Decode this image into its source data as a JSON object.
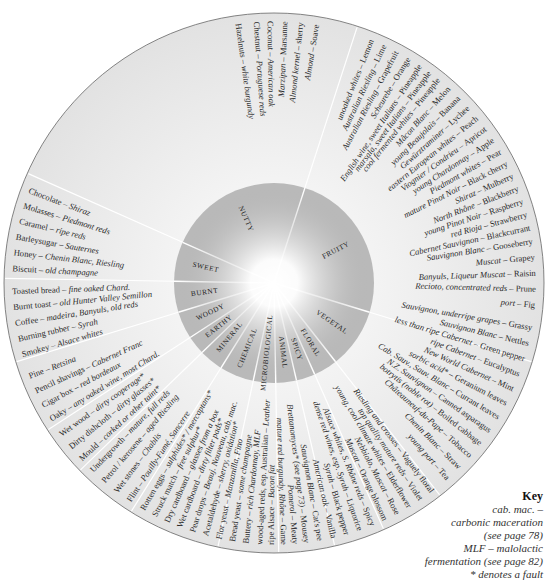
{
  "wheel": {
    "center": [
      274,
      283
    ],
    "outer_radius": 270,
    "inner_radius": 100,
    "colors": {
      "outer_ring": "#e9e9e9",
      "inner_ring": "#b9b9b9",
      "center_glow": "#ffffff",
      "divider": "#ffffff",
      "outline": "#666666"
    },
    "categories": [
      {
        "name": "FRUITY",
        "start": -72,
        "end": 17
      },
      {
        "name": "VEGETAL",
        "start": 17,
        "end": 52
      },
      {
        "name": "FLORAL",
        "start": 52,
        "end": 66
      },
      {
        "name": "SPICY",
        "start": 66,
        "end": 77
      },
      {
        "name": "ANIMAL",
        "start": 77,
        "end": 89
      },
      {
        "name": "MICROBIOLOGICAL",
        "start": 89,
        "end": 102
      },
      {
        "name": "CHEMICAL",
        "start": 102,
        "end": 122
      },
      {
        "name": "MINERAL",
        "start": 122,
        "end": 136
      },
      {
        "name": "EARTHY",
        "start": 136,
        "end": 147
      },
      {
        "name": "WOODY",
        "start": 147,
        "end": 163
      },
      {
        "name": "BURNT",
        "start": 163,
        "end": 181
      },
      {
        "name": "SWEET",
        "start": 181,
        "end": 204
      },
      {
        "name": "NUTTY",
        "start": 204,
        "end": 288
      }
    ],
    "aromas": [
      {
        "a": -98,
        "wine": "Hazelnuts",
        "aroma": "white burgundy"
      },
      {
        "a": -94,
        "wine": "Chestnut",
        "aroma": "Portuguese reds"
      },
      {
        "a": -91,
        "wine": "Coconut",
        "aroma": "American oak"
      },
      {
        "a": -87.5,
        "wine": "Marzipan",
        "aroma": "Marsanne"
      },
      {
        "a": -84,
        "wine": "Almond kernel",
        "aroma": "sherry"
      },
      {
        "a": -80.5,
        "wine": "Almond",
        "aroma": "Soave"
      },
      {
        "a": -68,
        "wine": "unoaked whites",
        "aroma": "Lemon",
        "tag": "lemon"
      },
      {
        "a": -65,
        "wine": "Australian Riesling",
        "aroma": "Lime"
      },
      {
        "a": -62,
        "wine": "Australian Riesling",
        "aroma": "Grapefruit"
      },
      {
        "a": -59,
        "wine": "Scheurebe",
        "aroma": "Orange"
      },
      {
        "a": -56,
        "wine": "English wine, sweet Italians",
        "aroma": "Pineapple"
      },
      {
        "a": -53.5,
        "wine": "marsala, sweet Italians",
        "aroma": "Pineapple"
      },
      {
        "a": -51,
        "wine": "cool fermented whites",
        "aroma": "Pineapple"
      },
      {
        "a": -48,
        "wine": "Mâcon Blanc",
        "aroma": "Melon"
      },
      {
        "a": -45,
        "wine": "young Beaujolais",
        "aroma": "Banana"
      },
      {
        "a": -42,
        "wine": "Gewürztraminer",
        "aroma": "Lychee"
      },
      {
        "a": -39,
        "wine": "eastern European whites",
        "aroma": "Peach"
      },
      {
        "a": -36,
        "wine": "Viognier / Condrieu",
        "aroma": "Apricot"
      },
      {
        "a": -33,
        "wine": "young Chardonnay",
        "aroma": "Apple"
      },
      {
        "a": -30,
        "wine": "Piedmont whites",
        "aroma": "Pear"
      },
      {
        "a": -27,
        "wine": "mature Pinot Noir",
        "aroma": "Black cherry"
      },
      {
        "a": -24,
        "wine": "Shiraz",
        "aroma": "Mulberry"
      },
      {
        "a": -21,
        "wine": "North Rhône",
        "aroma": "Blackberry"
      },
      {
        "a": -18,
        "wine": "young Pinot Noir",
        "aroma": "Raspberry"
      },
      {
        "a": -15,
        "wine": "red Rioja",
        "aroma": "Strawberry"
      },
      {
        "a": -12,
        "wine": "Cabernet Sauvignon",
        "aroma": "Blackcurrant"
      },
      {
        "a": -9,
        "wine": "Sauvignon Blanc",
        "aroma": "Gooseberry"
      },
      {
        "a": -5.5,
        "wine": "Muscat",
        "aroma": "Grapey"
      },
      {
        "a": -2,
        "wine": "Banyuls, Liqueur Muscat",
        "aroma": "Raisin"
      },
      {
        "a": 1.5,
        "wine": "Recioto, concentrated reds",
        "aroma": "Prune"
      },
      {
        "a": 5,
        "wine": "port",
        "aroma": "Fig"
      },
      {
        "a": 10,
        "wine": "Sauvignon, underripe grapes",
        "aroma": "Grassy"
      },
      {
        "a": 13.5,
        "wine": "Sauvignon Blanc",
        "aroma": "Nettles"
      },
      {
        "a": 17,
        "wine": "less than ripe Cabernet",
        "aroma": "Green pepper"
      },
      {
        "a": 20.5,
        "wine": "ripe Cabernet",
        "aroma": "Eucalyptus"
      },
      {
        "a": 24,
        "wine": "New World Cabernet",
        "aroma": "Mint"
      },
      {
        "a": 27.5,
        "wine": "sorbic acid*",
        "aroma": "Geranium leaves"
      },
      {
        "a": 31,
        "wine": "Cab. Sauv., Sauv. Blanc",
        "aroma": "Currant leaves"
      },
      {
        "a": 34.5,
        "wine": "N.Z. Sauvignon",
        "aroma": "Canned asparagus"
      },
      {
        "a": 38,
        "wine": "botrytis (noble rot)",
        "aroma": "Boiled cabbage"
      },
      {
        "a": 41.5,
        "wine": "Châteauneuf-du-Pape",
        "aroma": "Tobacco"
      },
      {
        "a": 45,
        "wine": "Chenin Blanc",
        "aroma": "Straw"
      },
      {
        "a": 48.5,
        "wine": "young port",
        "aroma": "Tea"
      },
      {
        "a": 53,
        "wine": "Riesling and crosses",
        "aroma": "Vaguely floral"
      },
      {
        "a": 56,
        "wine": "top quality mature reds",
        "aroma": "Violet"
      },
      {
        "a": 59,
        "wine": "young, cool climate whites",
        "aroma": "Elderflower"
      },
      {
        "a": 62,
        "wine": "Nebbiolo, Muscat",
        "aroma": "Rose"
      },
      {
        "a": 65,
        "wine": "Muscat",
        "aroma": "Orange blossom"
      },
      {
        "a": 68,
        "wine": "Alsace whites, S. Rhône reds",
        "aroma": "Spicy"
      },
      {
        "a": 71,
        "wine": "dense red wines, esp. Syrah",
        "aroma": "Liquorice"
      },
      {
        "a": 74,
        "wine": "Syrah",
        "aroma": "Black pepper"
      },
      {
        "a": 77,
        "wine": "American oak",
        "aroma": "Vanilla"
      },
      {
        "a": 80,
        "wine": "Sauvignon Blanc",
        "aroma": "Cat's pee"
      },
      {
        "a": 83,
        "wine": "Brettanomyces* (see page 73)",
        "aroma": "Mousey"
      },
      {
        "a": 85.5,
        "wine": "Pomerol",
        "aroma": "Meaty"
      },
      {
        "a": 88,
        "wine": "mature red burgundy, Rhône",
        "aroma": "Game"
      },
      {
        "a": 90.5,
        "wine": "ripe Alsace",
        "aroma": "Bacon fat"
      },
      {
        "a": 93,
        "wine": "wood-aged reds, esp. Australian",
        "aroma": "Leather"
      },
      {
        "a": 96,
        "wine": "Buttery",
        "aroma": "rich Chardonnay, MLF",
        "rev": true
      },
      {
        "a": 99,
        "wine": "Bread yeast",
        "aroma": "some champagne",
        "rev": true
      },
      {
        "a": 102,
        "wine": "Flor yeast",
        "aroma": "Manzanilla, Fino",
        "rev": true
      },
      {
        "a": 105,
        "wine": "Acetaldehyde",
        "aroma": "sherry, oxidation*",
        "rev": true
      },
      {
        "a": 108,
        "wine": "Pear drops",
        "aroma": "Beauj. Nouveau, cab. mac.",
        "rev": true
      },
      {
        "a": 111,
        "wine": "Wet cardboard",
        "aroma": "dirty filter pads*",
        "rev": true
      },
      {
        "a": 114,
        "wine": "Dry cardboard",
        "aroma": "glasses from a box",
        "rev": true
      },
      {
        "a": 117,
        "wine": "Struck match",
        "aroma": "free sulphur*",
        "rev": true
      },
      {
        "a": 120,
        "wine": "Rotten eggs",
        "aroma": "sulphides* / mercaptans*",
        "rev": true
      },
      {
        "a": 123.5,
        "wine": "Flint",
        "aroma": "Pouilly-Fumé, Sancerre",
        "rev": true
      },
      {
        "a": 127,
        "wine": "Wet stones",
        "aroma": "Chablis",
        "rev": true
      },
      {
        "a": 130.5,
        "wine": "Petrol / kerosene",
        "aroma": "aged Riesling",
        "rev": true
      },
      {
        "a": 134,
        "wine": "Undergrowth",
        "aroma": "mature, full reds",
        "rev": true
      },
      {
        "a": 137.5,
        "wine": "Mould",
        "aroma": "corked or other taint*",
        "rev": true
      },
      {
        "a": 141,
        "wine": "Dirty dishcloth",
        "aroma": "dirty glasses*",
        "rev": true
      },
      {
        "a": 144.5,
        "wine": "Wet wood",
        "aroma": "dirty cooperage*",
        "rev": true
      },
      {
        "a": 148.5,
        "wine": "Oaky",
        "aroma": "any oaked wine, most Chard.",
        "rev": true
      },
      {
        "a": 152,
        "wine": "Cigar box",
        "aroma": "red bordeaux",
        "rev": true
      },
      {
        "a": 155.5,
        "wine": "Pencil shavings",
        "aroma": "Cabernet Franc",
        "rev": true
      },
      {
        "a": 159,
        "wine": "Pine",
        "aroma": "Retsina",
        "rev": true
      },
      {
        "a": 164,
        "wine": "Smokey",
        "aroma": "Alsace whites",
        "rev": true
      },
      {
        "a": 167.5,
        "wine": "Burning rubber",
        "aroma": "Syrah",
        "rev": true
      },
      {
        "a": 171,
        "wine": "Coffee",
        "aroma": "madeira, Banyuls, old reds",
        "rev": true
      },
      {
        "a": 174.5,
        "wine": "Burnt toast",
        "aroma": "old Hunter Valley Semillon",
        "rev": true
      },
      {
        "a": 178,
        "wine": "Toasted bread",
        "aroma": "fine oaked Chard.",
        "rev": true
      },
      {
        "a": 183,
        "wine": "Biscuit",
        "aroma": "old champagne",
        "rev": true
      },
      {
        "a": 186.5,
        "wine": "Honey",
        "aroma": "Chenin Blanc, Riesling",
        "rev": true
      },
      {
        "a": 190,
        "wine": "Barleysugar",
        "aroma": "Sauternes",
        "rev": true
      },
      {
        "a": 193.5,
        "wine": "Caramel",
        "aroma": "ripe reds",
        "rev": true
      },
      {
        "a": 197,
        "wine": "Molasses",
        "aroma": "Piedmont reds",
        "rev": true
      },
      {
        "a": 200.5,
        "wine": "Chocolate",
        "aroma": "Shiraz",
        "rev": true
      }
    ]
  },
  "key": {
    "title": "Key",
    "lines": [
      "cab. mac. –",
      "carbonic maceration",
      "(see page 78)",
      "MLF – malolactic",
      "fermentation (see page 82)",
      "* denotes a fault"
    ]
  }
}
